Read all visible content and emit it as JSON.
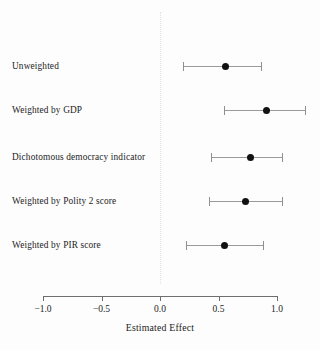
{
  "chart_data": {
    "type": "scatter",
    "subtype": "forest-plot",
    "title": "",
    "xlabel": "Estimated Effect",
    "ylabel": "",
    "xlim": [
      -1.0,
      1.0
    ],
    "xticks": [
      -1.0,
      -0.5,
      0.0,
      0.5,
      1.0
    ],
    "xticklabels": [
      "−1.0",
      "−0.5",
      "0.0",
      "0.5",
      "1.0"
    ],
    "grid": false,
    "legend": null,
    "reference_line": 0.0,
    "reference_line_style": "dotted",
    "categories": [
      "Unweighted",
      "Weighted by GDP",
      "Dichotomous democracy indicator",
      "Weighted by Polity 2 score",
      "Weighted by PIR score"
    ],
    "estimates": [
      0.56,
      0.91,
      0.77,
      0.73,
      0.55
    ],
    "ci_low": [
      0.2,
      0.55,
      0.44,
      0.42,
      0.22
    ],
    "ci_high": [
      0.87,
      1.25,
      1.05,
      1.05,
      0.89
    ],
    "points": [
      {
        "label": "Unweighted",
        "estimate": 0.56,
        "ci_low": 0.2,
        "ci_high": 0.87
      },
      {
        "label": "Weighted by GDP",
        "estimate": 0.91,
        "ci_low": 0.55,
        "ci_high": 1.25
      },
      {
        "label": "Dichotomous democracy indicator",
        "estimate": 0.77,
        "ci_low": 0.44,
        "ci_high": 1.05
      },
      {
        "label": "Weighted by Polity 2 score",
        "estimate": 0.73,
        "ci_low": 0.42,
        "ci_high": 1.05
      },
      {
        "label": "Weighted by PIR score",
        "estimate": 0.55,
        "ci_low": 0.22,
        "ci_high": 0.89
      }
    ],
    "colors": {
      "point": "#111111",
      "whisker": "#9a9a9a",
      "axis": "#6f6f6f",
      "reference_line": "#e2e2e2",
      "text": "#232323",
      "background": "#fdfdfd"
    }
  }
}
